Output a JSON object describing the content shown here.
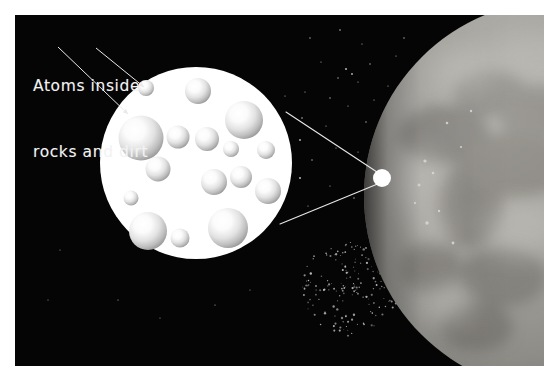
{
  "figure": {
    "title": "Atoms inside rocks and dirt",
    "kind": "astronomy-illustration",
    "frame": {
      "canvas_width": 559,
      "canvas_height": 380,
      "panel_left": 15,
      "panel_top": 15,
      "panel_width": 529,
      "panel_height": 351,
      "panel_background": "#050505",
      "page_background": "#ffffff"
    }
  },
  "caption": {
    "line1": "Atoms inside",
    "line2": "rocks and dirt",
    "color": "#f2f2f2",
    "font_size_px": 15.5
  },
  "callout_arrows": [
    {
      "name": "arrow-to-large-atom",
      "x1": 58,
      "y1": 47,
      "x2": 128,
      "y2": 114,
      "head": "filled"
    },
    {
      "name": "arrow-to-small-atom",
      "x1": 96,
      "y1": 48,
      "x2": 144,
      "y2": 87,
      "head": "filled"
    }
  ],
  "magnifier": {
    "name": "magnified-sample-circle",
    "center_x": 196,
    "center_y": 163,
    "radius": 96,
    "fill": "#ffffff",
    "label": "Magnified view of rock and dirt sample"
  },
  "magnifier_cone": {
    "name": "magnification-cone-lines",
    "color": "#e8e8e8",
    "stroke_width": 1.1,
    "apex_x": 382,
    "apex_y": 178,
    "top_line": {
      "x1": 286,
      "y1": 112,
      "x2": 380,
      "y2": 174
    },
    "bottom_line": {
      "x1": 280,
      "y1": 224,
      "x2": 380,
      "y2": 183
    }
  },
  "focus_point": {
    "name": "planet-surface-focus-spot",
    "cx": 382,
    "cy": 178,
    "r": 9,
    "fill": "#ffffff"
  },
  "planet": {
    "name": "planet-body",
    "center_x": 560,
    "center_y": 196,
    "radius": 196,
    "base_color": "#9c9a96",
    "dark_patch_color": "#77746f",
    "light_patch_color": "#c6c4bf",
    "limb_shadow_color": "#2a2a2a",
    "label": "Rocky planet surface"
  },
  "atoms": [
    {
      "cx": 146,
      "cy": 88,
      "r": 8,
      "name": "atom-sphere"
    },
    {
      "cx": 198,
      "cy": 91,
      "r": 13,
      "name": "atom-sphere"
    },
    {
      "cx": 244,
      "cy": 120,
      "r": 19,
      "name": "atom-sphere"
    },
    {
      "cx": 141,
      "cy": 138,
      "r": 22.5,
      "name": "atom-sphere"
    },
    {
      "cx": 178,
      "cy": 137,
      "r": 11.5,
      "name": "atom-sphere"
    },
    {
      "cx": 207,
      "cy": 139,
      "r": 12,
      "name": "atom-sphere"
    },
    {
      "cx": 231,
      "cy": 149,
      "r": 8,
      "name": "atom-sphere"
    },
    {
      "cx": 266,
      "cy": 150,
      "r": 9,
      "name": "atom-sphere"
    },
    {
      "cx": 158,
      "cy": 169,
      "r": 12.5,
      "name": "atom-sphere"
    },
    {
      "cx": 214,
      "cy": 182,
      "r": 13,
      "name": "atom-sphere"
    },
    {
      "cx": 241,
      "cy": 177,
      "r": 11,
      "name": "atom-sphere"
    },
    {
      "cx": 131,
      "cy": 198,
      "r": 7.5,
      "name": "atom-sphere"
    },
    {
      "cx": 268,
      "cy": 191,
      "r": 13,
      "name": "atom-sphere"
    },
    {
      "cx": 148,
      "cy": 231,
      "r": 19,
      "name": "atom-sphere"
    },
    {
      "cx": 180,
      "cy": 238,
      "r": 9.5,
      "name": "atom-sphere"
    },
    {
      "cx": 228,
      "cy": 228,
      "r": 20,
      "name": "atom-sphere"
    }
  ],
  "stars": {
    "name": "star-field",
    "sparse": [
      {
        "x": 310,
        "y": 38,
        "r": 0.7
      },
      {
        "x": 340,
        "y": 30,
        "r": 0.8
      },
      {
        "x": 362,
        "y": 44,
        "r": 0.6
      },
      {
        "x": 321,
        "y": 62,
        "r": 0.6
      },
      {
        "x": 370,
        "y": 64,
        "r": 0.7
      },
      {
        "x": 346,
        "y": 69,
        "r": 1.0
      },
      {
        "x": 352,
        "y": 74,
        "r": 0.9
      },
      {
        "x": 338,
        "y": 78,
        "r": 0.7
      },
      {
        "x": 358,
        "y": 82,
        "r": 0.6
      },
      {
        "x": 305,
        "y": 92,
        "r": 0.6
      },
      {
        "x": 330,
        "y": 98,
        "r": 0.7
      },
      {
        "x": 374,
        "y": 100,
        "r": 0.6
      },
      {
        "x": 348,
        "y": 106,
        "r": 0.6
      },
      {
        "x": 302,
        "y": 118,
        "r": 0.8
      },
      {
        "x": 326,
        "y": 126,
        "r": 0.6
      },
      {
        "x": 366,
        "y": 122,
        "r": 0.7
      },
      {
        "x": 300,
        "y": 140,
        "r": 0.9
      },
      {
        "x": 336,
        "y": 148,
        "r": 0.6
      },
      {
        "x": 312,
        "y": 160,
        "r": 0.7
      },
      {
        "x": 358,
        "y": 152,
        "r": 0.6
      },
      {
        "x": 300,
        "y": 178,
        "r": 1.0
      },
      {
        "x": 330,
        "y": 186,
        "r": 0.6
      },
      {
        "x": 354,
        "y": 198,
        "r": 0.7
      },
      {
        "x": 308,
        "y": 206,
        "r": 0.6
      },
      {
        "x": 285,
        "y": 96,
        "r": 0.6
      },
      {
        "x": 396,
        "y": 56,
        "r": 0.6
      },
      {
        "x": 404,
        "y": 38,
        "r": 0.7
      },
      {
        "x": 388,
        "y": 86,
        "r": 0.6
      },
      {
        "x": 118,
        "y": 300,
        "r": 0.6
      },
      {
        "x": 160,
        "y": 318,
        "r": 0.5
      },
      {
        "x": 215,
        "y": 305,
        "r": 0.6
      },
      {
        "x": 60,
        "y": 250,
        "r": 0.5
      },
      {
        "x": 48,
        "y": 300,
        "r": 0.5
      },
      {
        "x": 250,
        "y": 290,
        "r": 0.5
      }
    ],
    "cluster": {
      "center_x": 352,
      "center_y": 288,
      "spread_x": 52,
      "spread_y": 48,
      "count": 190
    }
  }
}
